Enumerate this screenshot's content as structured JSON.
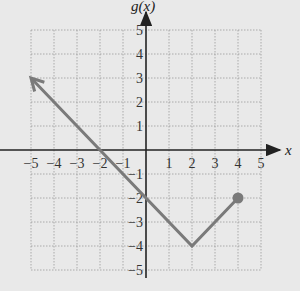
{
  "chart_data": {
    "type": "line",
    "title": "",
    "xlabel": "x",
    "ylabel": "g(x)",
    "xlim": [
      -5,
      5
    ],
    "ylim": [
      -5,
      5
    ],
    "grid": true,
    "x_ticks": [
      "-5",
      "-4",
      "-3",
      "-2",
      "-1",
      "1",
      "2",
      "3",
      "4",
      "5"
    ],
    "y_ticks": [
      "5",
      "4",
      "3",
      "2",
      "1",
      "-1",
      "-2",
      "-3",
      "-4",
      "-5"
    ],
    "series": [
      {
        "name": "g(x)",
        "color": "#7a7a7a",
        "points": [
          [
            -5,
            3
          ],
          [
            2,
            -4
          ],
          [
            4,
            -2
          ]
        ],
        "start": "arrow",
        "end": "closed-dot"
      }
    ]
  },
  "labels": {
    "x_axis": "x",
    "y_axis": "g(x)"
  }
}
